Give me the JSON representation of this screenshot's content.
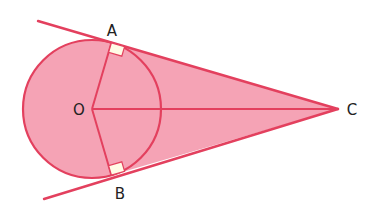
{
  "diagram": {
    "points": {
      "O": {
        "label": "O",
        "x": 92,
        "y": 109
      },
      "A": {
        "label": "A",
        "x": 111.4,
        "y": 42.8
      },
      "B": {
        "label": "B",
        "x": 111.4,
        "y": 175.2
      },
      "C": {
        "label": "C",
        "x": 338,
        "y": 109
      }
    },
    "circle": {
      "cx": 92,
      "cy": 109,
      "r": 69
    },
    "segments": [
      "OA",
      "OB",
      "OC",
      "AC",
      "BC"
    ],
    "right_angles": [
      "OAC",
      "OBC"
    ],
    "colors": {
      "fill": "#f5a3b5",
      "stroke": "#e3405e",
      "right_angle_marker": "#fffbe6",
      "label": "#222222"
    }
  }
}
